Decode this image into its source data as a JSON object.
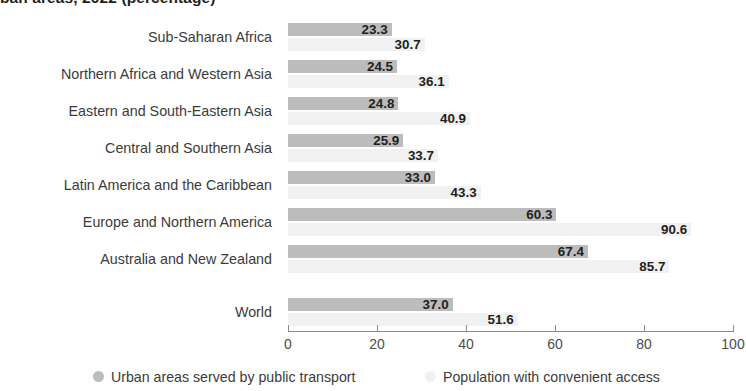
{
  "chart_data": {
    "type": "bar",
    "orientation": "horizontal",
    "title": "ban areas, 2022 (percentage)",
    "xlabel": "",
    "ylabel": "",
    "xlim": [
      0,
      100
    ],
    "grid": false,
    "legend_position": "bottom",
    "categories": [
      "Sub-Saharan Africa",
      "Northern Africa and Western Asia",
      "Eastern and South-Eastern Asia",
      "Central and Southern Asia",
      "Latin America and the Caribbean",
      "Europe and Northern America",
      "Australia and New Zealand",
      "World"
    ],
    "series": [
      {
        "name": "Urban areas served by public transport",
        "color": "#bcbcbc",
        "values": [
          23.3,
          24.5,
          24.8,
          25.9,
          33.0,
          60.3,
          67.4,
          37.0
        ],
        "labels": [
          "23.3",
          "24.5",
          "24.8",
          "25.9",
          "33.0",
          "60.3",
          "67.4",
          "37.0"
        ]
      },
      {
        "name": "Population with convenient access",
        "color": "#f1f1f1",
        "values": [
          30.7,
          36.1,
          40.9,
          33.7,
          43.3,
          90.6,
          85.7,
          51.6
        ],
        "labels": [
          "30.7",
          "36.1",
          "40.9",
          "33.7",
          "43.3",
          "90.6",
          "85.7",
          "51.6"
        ]
      }
    ],
    "xticks": [
      0,
      20,
      40,
      60,
      80,
      100
    ],
    "xtick_labels": [
      "0",
      "20",
      "40",
      "60",
      "80",
      "100"
    ]
  },
  "legend": {
    "items": [
      {
        "label": "Urban areas served by public transport",
        "color": "#bcbcbc"
      },
      {
        "label": "Population with convenient access",
        "color": "#f1f1f1"
      }
    ]
  }
}
